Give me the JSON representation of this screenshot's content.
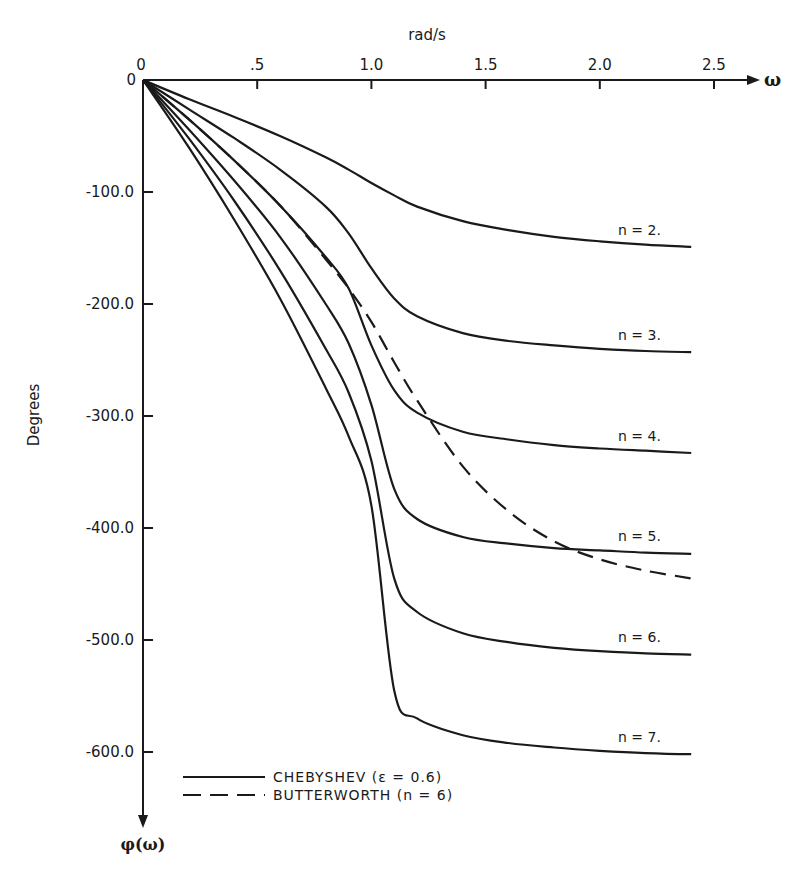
{
  "chart_data": {
    "type": "line",
    "title": "",
    "xlabel": "rad/s",
    "x_symbol": "ω",
    "ylabel": "Degrees",
    "y_symbol": "φ(ω)",
    "xlim": [
      0,
      2.6
    ],
    "ylim": [
      -650,
      0
    ],
    "x_ticks": [
      0,
      0.5,
      1.0,
      1.5,
      2.0,
      2.5
    ],
    "x_tick_labels": [
      "0",
      ".5",
      "1.0",
      "1.5",
      "2.0",
      "2.5"
    ],
    "y_ticks": [
      0,
      -100,
      -200,
      -300,
      -400,
      -500,
      -600
    ],
    "y_tick_labels": [
      "0",
      "-100.0",
      "-200.0",
      "-300.0",
      "-400.0",
      "-500.0",
      "-600.0"
    ],
    "grid": false,
    "legend_position": "bottom-left",
    "legend": [
      {
        "label": "CHEBYSHEV (ε = 0.6)",
        "style": "solid"
      },
      {
        "label": "BUTTERWORTH (n = 6)",
        "style": "dashed"
      }
    ],
    "x": [
      0,
      0.2,
      0.4,
      0.6,
      0.8,
      0.9,
      1.0,
      1.1,
      1.2,
      1.4,
      1.6,
      1.8,
      2.0,
      2.2,
      2.4
    ],
    "series": [
      {
        "name": "Chebyshev n = 2.",
        "style": "solid",
        "values": [
          0,
          -17,
          -33,
          -50,
          -69,
          -80,
          -92,
          -103,
          -113,
          -126,
          -134,
          -140,
          -144,
          -147,
          -149
        ]
      },
      {
        "name": "Chebyshev n = 3.",
        "style": "solid",
        "values": [
          0,
          -26,
          -52,
          -80,
          -113,
          -137,
          -168,
          -195,
          -211,
          -226,
          -233,
          -237,
          -240,
          -242,
          -243
        ]
      },
      {
        "name": "Chebyshev n = 4.",
        "style": "solid",
        "values": [
          0,
          -35,
          -72,
          -112,
          -158,
          -186,
          -237,
          -277,
          -297,
          -314,
          -321,
          -326,
          -329,
          -331,
          -333
        ]
      },
      {
        "name": "Chebyshev n = 5.",
        "style": "solid",
        "values": [
          0,
          -44,
          -90,
          -140,
          -200,
          -235,
          -290,
          -365,
          -392,
          -408,
          -414,
          -418,
          -420,
          -422,
          -423
        ]
      },
      {
        "name": "Chebyshev n = 6.",
        "style": "solid",
        "values": [
          0,
          -52,
          -108,
          -170,
          -240,
          -279,
          -340,
          -445,
          -475,
          -494,
          -502,
          -507,
          -510,
          -512,
          -513
        ]
      },
      {
        "name": "Chebyshev n = 7.",
        "style": "solid",
        "values": [
          0,
          -60,
          -125,
          -195,
          -275,
          -318,
          -380,
          -545,
          -570,
          -585,
          -592,
          -596,
          -599,
          -601,
          -602
        ]
      },
      {
        "name": "Butterworth n = 6",
        "style": "dashed",
        "values": [
          0,
          -35,
          -72,
          -112,
          -160,
          -186,
          -216,
          -252,
          -286,
          -345,
          -385,
          -412,
          -428,
          -438,
          -445
        ]
      }
    ],
    "curve_labels": [
      "n = 2.",
      "n = 3.",
      "n = 4.",
      "n = 5.",
      "n = 6.",
      "n = 7."
    ]
  }
}
